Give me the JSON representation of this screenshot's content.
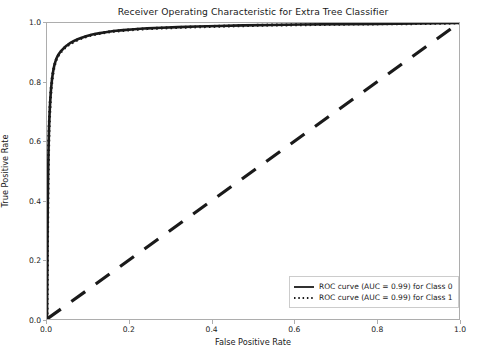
{
  "chart_data": {
    "type": "line",
    "title": "Receiver Operating Characteristic for Extra Tree Classifier",
    "xlabel": "False Positive Rate",
    "ylabel": "True Positive Rate",
    "xlim": [
      0.0,
      1.0
    ],
    "ylim": [
      0.0,
      1.0
    ],
    "grid": false,
    "legend_position": "lower right",
    "xticks": [
      "0.0",
      "0.2",
      "0.4",
      "0.6",
      "0.8",
      "1.0"
    ],
    "xtick_values": [
      0.0,
      0.2,
      0.4,
      0.6,
      0.8,
      1.0
    ],
    "yticks": [
      "0.0",
      "0.2",
      "0.4",
      "0.6",
      "0.8",
      "1.0"
    ],
    "ytick_values": [
      0.0,
      0.2,
      0.4,
      0.6,
      0.8,
      1.0
    ],
    "series": [
      {
        "name": "ROC curve (AUC = 0.99) for Class 0",
        "auc": 0.99,
        "class": "0",
        "linestyle": "solid",
        "color": "#1a1a1a",
        "x": [
          0.0,
          0.0008,
          0.0012,
          0.0016,
          0.002,
          0.0025,
          0.003,
          0.0035,
          0.004,
          0.0045,
          0.005,
          0.006,
          0.007,
          0.008,
          0.009,
          0.01,
          0.012,
          0.014,
          0.016,
          0.018,
          0.02,
          0.023,
          0.026,
          0.03,
          0.034,
          0.038,
          0.043,
          0.048,
          0.054,
          0.06,
          0.068,
          0.076,
          0.086,
          0.097,
          0.11,
          0.125,
          0.142,
          0.162,
          0.185,
          0.212,
          0.243,
          0.278,
          0.318,
          0.364,
          0.416,
          0.475,
          0.542,
          0.618,
          0.704,
          0.8,
          0.9,
          1.0
        ],
        "y": [
          0.0,
          0.16,
          0.26,
          0.34,
          0.4,
          0.46,
          0.51,
          0.555,
          0.59,
          0.62,
          0.645,
          0.685,
          0.715,
          0.74,
          0.762,
          0.78,
          0.808,
          0.829,
          0.845,
          0.858,
          0.868,
          0.88,
          0.889,
          0.898,
          0.905,
          0.911,
          0.918,
          0.924,
          0.93,
          0.935,
          0.941,
          0.946,
          0.951,
          0.956,
          0.961,
          0.965,
          0.969,
          0.973,
          0.976,
          0.979,
          0.982,
          0.984,
          0.986,
          0.988,
          0.99,
          0.992,
          0.993,
          0.995,
          0.996,
          0.997,
          0.9985,
          1.0
        ]
      },
      {
        "name": "ROC curve (AUC = 0.99) for Class 1",
        "auc": 0.99,
        "class": "1",
        "linestyle": "dotted",
        "color": "#1a1a1a",
        "x": [
          0.0,
          0.0008,
          0.0012,
          0.0016,
          0.002,
          0.0025,
          0.003,
          0.0035,
          0.004,
          0.0045,
          0.005,
          0.006,
          0.007,
          0.008,
          0.009,
          0.01,
          0.012,
          0.014,
          0.016,
          0.018,
          0.02,
          0.023,
          0.026,
          0.03,
          0.034,
          0.038,
          0.043,
          0.048,
          0.054,
          0.06,
          0.068,
          0.076,
          0.086,
          0.097,
          0.11,
          0.125,
          0.142,
          0.162,
          0.185,
          0.212,
          0.243,
          0.278,
          0.318,
          0.364,
          0.416,
          0.475,
          0.542,
          0.618,
          0.704,
          0.8,
          0.9,
          1.0
        ],
        "y": [
          0.0,
          0.155,
          0.255,
          0.335,
          0.395,
          0.455,
          0.505,
          0.55,
          0.585,
          0.615,
          0.64,
          0.68,
          0.711,
          0.736,
          0.758,
          0.776,
          0.805,
          0.826,
          0.843,
          0.856,
          0.866,
          0.878,
          0.887,
          0.896,
          0.903,
          0.909,
          0.916,
          0.922,
          0.928,
          0.933,
          0.939,
          0.944,
          0.95,
          0.955,
          0.96,
          0.964,
          0.968,
          0.972,
          0.975,
          0.978,
          0.981,
          0.983,
          0.985,
          0.987,
          0.989,
          0.991,
          0.993,
          0.994,
          0.996,
          0.997,
          0.998,
          1.0
        ]
      }
    ],
    "reference_line": {
      "name": "chance-diagonal",
      "linestyle": "dashed",
      "color": "#1a1a1a",
      "x": [
        0.0,
        1.0
      ],
      "y": [
        0.0,
        1.0
      ]
    }
  }
}
